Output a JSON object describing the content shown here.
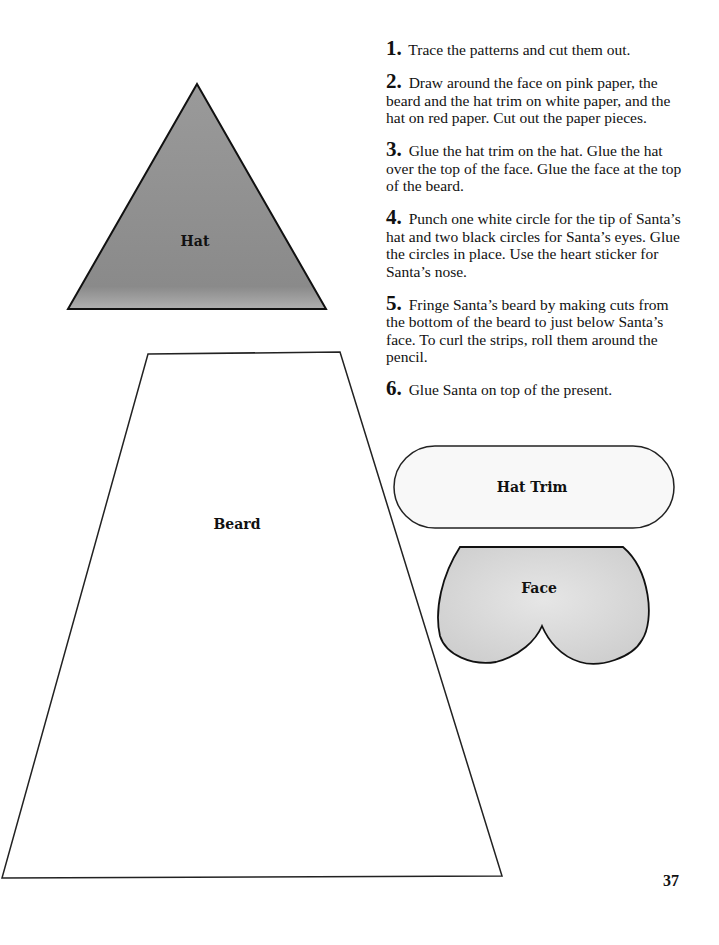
{
  "instructions": {
    "steps": [
      {
        "number": "1.",
        "text": "Trace the patterns and cut them out."
      },
      {
        "number": "2.",
        "text": "Draw around the face on pink paper, the beard and the hat trim on white paper, and the hat on red paper. Cut out the paper pieces."
      },
      {
        "number": "3.",
        "text": "Glue the hat trim on the hat. Glue the hat over the top of the face. Glue the face at the top of the beard."
      },
      {
        "number": "4.",
        "text": "Punch one white circle for the tip of Santa’s hat and two black circles for Santa’s eyes. Glue the circles in place. Use the heart sticker for Santa’s nose."
      },
      {
        "number": "5.",
        "text": "Fringe Santa’s beard by making cuts from the bottom of the beard to just below Santa’s face. To curl the strips, roll them around the pencil."
      },
      {
        "number": "6.",
        "text": "Glue Santa on top of the present."
      }
    ]
  },
  "patterns": {
    "hat": {
      "label": "Hat",
      "fill": "#8e8e8e"
    },
    "beard": {
      "label": "Beard",
      "fill": "#ffffff"
    },
    "hat_trim": {
      "label": "Hat Trim",
      "fill": "#ffffff"
    },
    "face": {
      "label": "Face",
      "fill": "#d9d9d9"
    }
  },
  "page_number": "37"
}
